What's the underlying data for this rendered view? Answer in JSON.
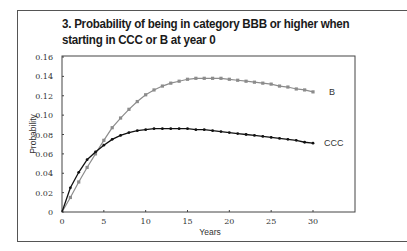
{
  "chart_data": {
    "type": "line",
    "title": "3. Probability of being in category BBB or higher when starting in CCC or B at year 0",
    "title_lines": [
      "3. Probability of being in category BBB or higher when",
      "starting in CCC or B at year 0"
    ],
    "xlabel": "Years",
    "ylabel": "Probability",
    "xlim": [
      0,
      30
    ],
    "ylim": [
      0,
      0.16
    ],
    "x_ticks": [
      0,
      5,
      10,
      15,
      20,
      25,
      30
    ],
    "y_ticks": [
      "0",
      "0.02",
      "0.04",
      "0.06",
      "0.08",
      "0.10",
      "0.12",
      "0.14",
      "0.16"
    ],
    "grid": false,
    "legend": "inline labels at line ends",
    "x": [
      0,
      1,
      2,
      3,
      4,
      5,
      6,
      7,
      8,
      9,
      10,
      11,
      12,
      13,
      14,
      15,
      16,
      17,
      18,
      19,
      20,
      21,
      22,
      23,
      24,
      25,
      26,
      27,
      28,
      29,
      30
    ],
    "series": [
      {
        "name": "B",
        "color": "#8c8c8c",
        "marker": "square",
        "values": [
          0,
          0.015,
          0.031,
          0.046,
          0.06,
          0.074,
          0.087,
          0.097,
          0.106,
          0.114,
          0.121,
          0.126,
          0.13,
          0.133,
          0.135,
          0.137,
          0.138,
          0.138,
          0.138,
          0.138,
          0.137,
          0.136,
          0.135,
          0.134,
          0.133,
          0.132,
          0.13,
          0.129,
          0.127,
          0.126,
          0.124
        ]
      },
      {
        "name": "CCC",
        "color": "#111111",
        "marker": "circle",
        "values": [
          0,
          0.025,
          0.041,
          0.054,
          0.062,
          0.069,
          0.075,
          0.079,
          0.082,
          0.084,
          0.085,
          0.086,
          0.086,
          0.086,
          0.086,
          0.086,
          0.085,
          0.085,
          0.084,
          0.083,
          0.082,
          0.081,
          0.08,
          0.079,
          0.078,
          0.077,
          0.076,
          0.075,
          0.074,
          0.072,
          0.071
        ]
      }
    ]
  }
}
